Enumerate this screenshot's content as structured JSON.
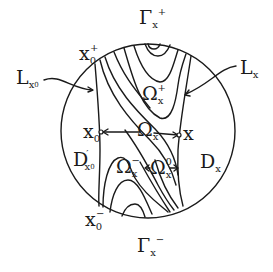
{
  "diagram": {
    "colors": {
      "ink": "#1a1a1a",
      "background": "#ffffff"
    },
    "labels": {
      "gamma_plus": {
        "base": "Γ",
        "sub": "x",
        "sup": "+"
      },
      "gamma_minus": {
        "base": "Γ",
        "sub": "x",
        "sup": "−"
      },
      "x0_plus": {
        "base": "x",
        "sub": "0",
        "sup": "+"
      },
      "x0_minus": {
        "base": "x",
        "sub": "0",
        "sup": "−"
      },
      "L_x0": {
        "base": "L",
        "sub": "x",
        "subsub": "0"
      },
      "L_x": {
        "base": "L",
        "sub": "x"
      },
      "omega_plus": {
        "base": "Ω",
        "sub": "x",
        "sup": "+"
      },
      "omega_center": {
        "base": "Ω",
        "sub": "x"
      },
      "omega_minus": {
        "base": "Ω",
        "sub": "x",
        "sup": "−"
      },
      "omega_zero": {
        "base": "Ω",
        "sub": "x",
        "sup": "0"
      },
      "x0": {
        "base": "x",
        "sub": "0"
      },
      "x": {
        "base": "x"
      },
      "D_prime": {
        "base": "D",
        "sup": "′",
        "sub": "x",
        "subsub": "0"
      },
      "D_x": {
        "base": "D",
        "sub": "x"
      }
    }
  }
}
